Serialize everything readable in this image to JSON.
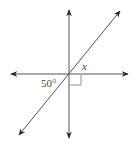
{
  "diagram": {
    "type": "intersecting-lines",
    "angle_label": "50°",
    "unknown_label": "x",
    "right_angle_marker": true,
    "line_color": "#333333"
  }
}
